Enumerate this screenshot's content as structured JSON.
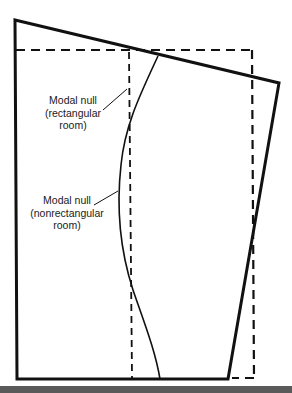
{
  "diagram": {
    "labels": {
      "rectangular": {
        "line1": "Modal null",
        "line2": "(rectangular",
        "line3": "room)"
      },
      "nonrectangular": {
        "line1": "Modal null",
        "line2": "(nonrectangular",
        "line3": "room)"
      }
    },
    "colors": {
      "stroke": "#111111",
      "background": "#ffffff",
      "bottom_bar": "#5a5a5a"
    }
  }
}
